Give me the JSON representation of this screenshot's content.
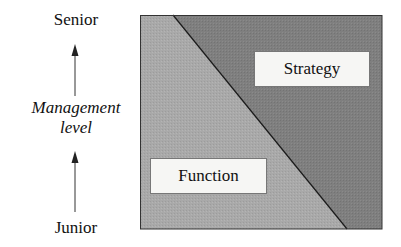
{
  "y_axis": {
    "top_label": "Senior",
    "bottom_label": "Junior",
    "title_line1": "Management",
    "title_line2": "level"
  },
  "regions": [
    {
      "name": "Function",
      "color": "#a9a9a9",
      "position": "lower-left"
    },
    {
      "name": "Strategy",
      "color": "#7f7f7f",
      "position": "upper-right"
    }
  ],
  "labels": {
    "strategy": "Strategy",
    "function": "Function"
  },
  "colors": {
    "function_fill": "#a9a9a9",
    "strategy_fill": "#7f7f7f",
    "border": "#333333",
    "label_bg": "#f6f6f4"
  }
}
